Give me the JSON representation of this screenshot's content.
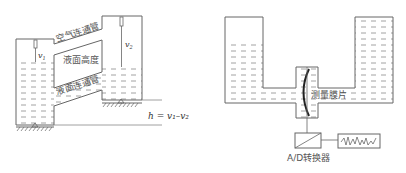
{
  "left_diagram": {
    "air_pipe_label": "空气连通管",
    "level_label": "液面高度",
    "liquid_pipe_label": "液面连通管",
    "v1_label": "v",
    "v1_sub": "1",
    "v2_label": "v",
    "v2_sub": "2",
    "formula": "h = v₁–v₂"
  },
  "right_diagram": {
    "membrane_label": "测量膜片",
    "converter_label": "A/D转换器"
  },
  "colors": {
    "line": "#666666",
    "dash": "#888888",
    "membrane": "#222222"
  }
}
